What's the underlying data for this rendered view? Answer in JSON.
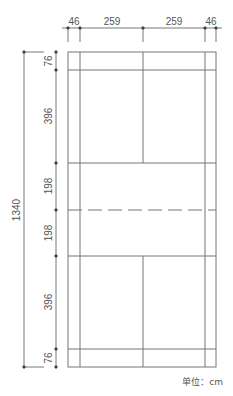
{
  "diagram": {
    "type": "badminton-court-plan",
    "unit_label": "单位：cm",
    "colors": {
      "line": "#777777",
      "dim_line": "#555555",
      "text": "#555555",
      "background": "#ffffff"
    },
    "width_dimensions": [
      "46",
      "259",
      "259",
      "46"
    ],
    "length_dimensions": [
      "76",
      "396",
      "198",
      "198",
      "396",
      "76"
    ],
    "total_length": "1340",
    "net": "dashed center line"
  }
}
